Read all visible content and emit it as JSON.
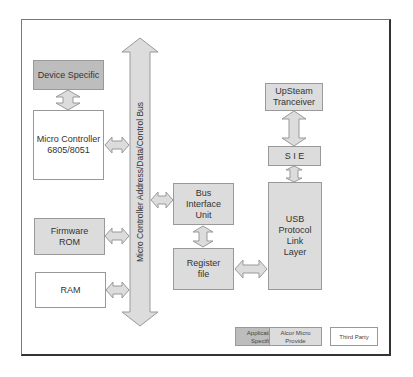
{
  "diagram": {
    "bus": {
      "label": "Micro Controller Address/Data/Control Bus"
    },
    "blocks": {
      "device_specific": "Device Specific",
      "micro_controller": "Micro Controller\n6805/8051",
      "firmware_rom": "Firmware\nROM",
      "ram": "RAM",
      "bus_interface_unit": "Bus\nInterface\nUnit",
      "register_file": "Register\nfile",
      "upstream_transceiver": "UpSteam\nTranceiver",
      "sie": "S I E",
      "usb_protocol": "USB\nProtocol\nLink\nLayer"
    },
    "legend": [
      {
        "label": "Application\nSpecific",
        "color": "#bdbdbd"
      },
      {
        "label": "Alcor Micro\nProvide",
        "color": "#dcdcdc"
      },
      {
        "label": "Third Party",
        "color": "#ffffff"
      }
    ],
    "colors": {
      "application_specific": "#bdbdbd",
      "alcor_micro": "#dcdcdc",
      "third_party": "#ffffff",
      "border": "#999999"
    }
  }
}
